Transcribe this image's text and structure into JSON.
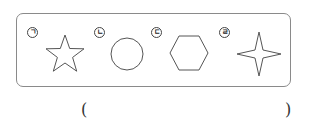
{
  "figure": {
    "items": [
      {
        "label": "ㄱ",
        "shape": "five-pointed-star"
      },
      {
        "label": "ㄴ",
        "shape": "circle"
      },
      {
        "label": "ㄷ",
        "shape": "hexagon"
      },
      {
        "label": "ㄹ",
        "shape": "four-pointed-star"
      }
    ]
  },
  "answer": {
    "open_paren": "(",
    "close_paren": ")",
    "value": ""
  }
}
